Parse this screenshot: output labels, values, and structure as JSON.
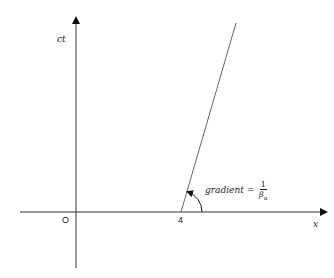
{
  "diagram": {
    "type": "spacetime-diagram",
    "axes": {
      "x_label": "x",
      "y_label": "ct",
      "origin_label": "O",
      "color": "#222222"
    },
    "worldline": {
      "x_intercept_label": "4",
      "color": "#444444"
    },
    "annotation": {
      "text": "gradient =",
      "fraction_numerator": "1",
      "fraction_denominator": "β",
      "fraction_denominator_subscript": "u"
    }
  }
}
